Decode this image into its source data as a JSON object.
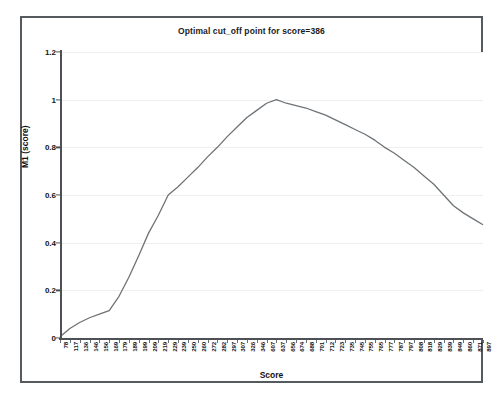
{
  "chart_data": {
    "type": "line",
    "title": "Optimal cut_off point for score=386",
    "xlabel": "Score",
    "ylabel": "M1 (score)",
    "ylim": [
      0,
      1.2
    ],
    "yticks": [
      "0",
      "0.2",
      "0.4",
      "0.6",
      "0.8",
      "1",
      "1.2"
    ],
    "ytick_values": [
      0,
      0.2,
      0.4,
      0.6,
      0.8,
      1,
      1.2
    ],
    "grid": true,
    "legend": "none",
    "categories": [
      "78",
      "117",
      "136",
      "146",
      "156",
      "169",
      "179",
      "189",
      "199",
      "209",
      "219",
      "229",
      "239",
      "250",
      "260",
      "272",
      "282",
      "297",
      "307",
      "326",
      "346",
      "607",
      "637",
      "656",
      "674",
      "688",
      "701",
      "712",
      "723",
      "735",
      "745",
      "755",
      "765",
      "777",
      "787",
      "797",
      "808",
      "818",
      "829",
      "839",
      "849",
      "860",
      "871",
      "897"
    ],
    "values": [
      0.005,
      0.04,
      0.065,
      0.085,
      0.1,
      0.115,
      0.175,
      0.255,
      0.345,
      0.44,
      0.515,
      0.6,
      0.635,
      0.675,
      0.715,
      0.76,
      0.8,
      0.845,
      0.885,
      0.925,
      0.955,
      0.985,
      1.0,
      0.985,
      0.975,
      0.965,
      0.95,
      0.935,
      0.915,
      0.895,
      0.875,
      0.855,
      0.83,
      0.8,
      0.775,
      0.745,
      0.715,
      0.68,
      0.645,
      0.6,
      0.555,
      0.525,
      0.5,
      0.475
    ],
    "annotations": {
      "optimal_cut_off_score": "386",
      "peak_value": "1"
    },
    "series": [
      {
        "name": "M1 (score)",
        "values": [
          0.005,
          0.04,
          0.065,
          0.085,
          0.1,
          0.115,
          0.175,
          0.255,
          0.345,
          0.44,
          0.515,
          0.6,
          0.635,
          0.675,
          0.715,
          0.76,
          0.8,
          0.845,
          0.885,
          0.925,
          0.955,
          0.985,
          1.0,
          0.985,
          0.975,
          0.965,
          0.95,
          0.935,
          0.915,
          0.895,
          0.875,
          0.855,
          0.83,
          0.8,
          0.775,
          0.745,
          0.715,
          0.68,
          0.645,
          0.6,
          0.555,
          0.525,
          0.5,
          0.475
        ]
      }
    ],
    "line_color": "#6e7377"
  }
}
